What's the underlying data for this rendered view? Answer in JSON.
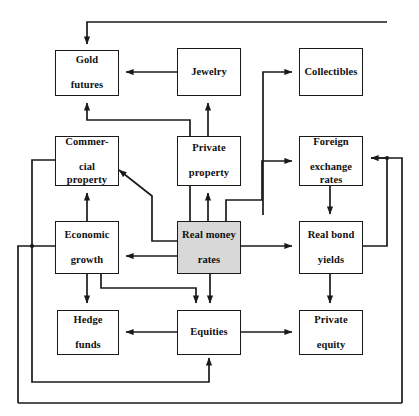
{
  "diagram": {
    "type": "flow-diagram",
    "background_color": "#ffffff",
    "line_color": "#1a1a1a",
    "highlight_color": "#d8d8d8",
    "nodes": [
      {
        "id": "gold_futures",
        "label": "Gold\nfutures",
        "label_line1": "Gold",
        "label_line2": "futures",
        "x": 55,
        "y": 50,
        "w": 64,
        "h": 46,
        "highlight": false
      },
      {
        "id": "jewelry",
        "label": "Jewelry",
        "label_line1": "Jewelry",
        "label_line2": "",
        "x": 177,
        "y": 48,
        "w": 64,
        "h": 48,
        "highlight": false
      },
      {
        "id": "collectibles",
        "label": "Collectibles",
        "label_line1": "Collectibles",
        "label_line2": "",
        "x": 299,
        "y": 48,
        "w": 64,
        "h": 48,
        "highlight": false
      },
      {
        "id": "commercial_property",
        "label": "Commer-\ncial\nproperty",
        "label_line1": "Commer-",
        "label_line2": "cial property",
        "x": 55,
        "y": 136,
        "w": 64,
        "h": 50,
        "highlight": false
      },
      {
        "id": "private_property",
        "label": "Private\nproperty",
        "label_line1": "Private",
        "label_line2": "property",
        "x": 177,
        "y": 136,
        "w": 64,
        "h": 50,
        "highlight": false
      },
      {
        "id": "fx_rates",
        "label": "Foreign\nexchange\nrates",
        "label_line1": "Foreign",
        "label_line2": "exchange rates",
        "x": 299,
        "y": 136,
        "w": 64,
        "h": 50,
        "highlight": false
      },
      {
        "id": "economic_growth",
        "label": "Economic\ngrowth",
        "label_line1": "Economic",
        "label_line2": "growth",
        "x": 55,
        "y": 221,
        "w": 64,
        "h": 53,
        "highlight": false
      },
      {
        "id": "real_money_rates",
        "label": "Real money\nrates",
        "label_line1": "Real money",
        "label_line2": "rates",
        "x": 177,
        "y": 221,
        "w": 64,
        "h": 53,
        "highlight": true
      },
      {
        "id": "real_bond_yields",
        "label": "Real bond\nyields",
        "label_line1": "Real bond",
        "label_line2": "yields",
        "x": 299,
        "y": 221,
        "w": 64,
        "h": 53,
        "highlight": false
      },
      {
        "id": "hedge_funds",
        "label": "Hedge\nfunds",
        "label_line1": "Hedge",
        "label_line2": "funds",
        "x": 57,
        "y": 310,
        "w": 62,
        "h": 45,
        "highlight": false
      },
      {
        "id": "equities",
        "label": "Equities",
        "label_line1": "Equities",
        "label_line2": "",
        "x": 177,
        "y": 310,
        "w": 64,
        "h": 45,
        "highlight": false
      },
      {
        "id": "private_equity",
        "label": "Private\nequity",
        "label_line1": "Private",
        "label_line2": "equity",
        "x": 299,
        "y": 310,
        "w": 64,
        "h": 45,
        "highlight": false
      }
    ],
    "edges": [
      {
        "from": "jewelry",
        "to": "gold_futures",
        "label": ""
      },
      {
        "from": "private_property",
        "to": "jewelry",
        "label": ""
      },
      {
        "from": "real_money_rates",
        "to": "collectibles",
        "label": ""
      },
      {
        "from": "real_money_rates",
        "to": "gold_futures",
        "label": ""
      },
      {
        "from": "real_money_rates",
        "to": "private_property",
        "label": ""
      },
      {
        "from": "real_money_rates",
        "to": "commercial_property",
        "label": ""
      },
      {
        "from": "real_money_rates",
        "to": "economic_growth",
        "label": ""
      },
      {
        "from": "real_money_rates",
        "to": "fx_rates",
        "label": ""
      },
      {
        "from": "real_money_rates",
        "to": "real_bond_yields",
        "label": ""
      },
      {
        "from": "real_money_rates",
        "to": "equities",
        "label": ""
      },
      {
        "from": "economic_growth",
        "to": "commercial_property",
        "label": ""
      },
      {
        "from": "economic_growth",
        "to": "hedge_funds",
        "label": ""
      },
      {
        "from": "economic_growth",
        "to": "equities",
        "label": ""
      },
      {
        "from": "equities",
        "to": "hedge_funds",
        "label": ""
      },
      {
        "from": "equities",
        "to": "private_equity",
        "label": ""
      },
      {
        "from": "fx_rates",
        "to": "real_bond_yields",
        "label": ""
      },
      {
        "from": "real_bond_yields",
        "to": "private_equity",
        "label": ""
      },
      {
        "from": "real_bond_yields",
        "to": "fx_rates",
        "label": ""
      },
      {
        "from": "commercial_property",
        "to": "gold_futures",
        "label": ""
      },
      {
        "from": "commercial_property",
        "to": "equities",
        "label": ""
      },
      {
        "from": "economic_growth",
        "to": "gold_futures",
        "label": ""
      },
      {
        "from": "economic_growth",
        "to": "fx_rates",
        "label": ""
      }
    ]
  }
}
